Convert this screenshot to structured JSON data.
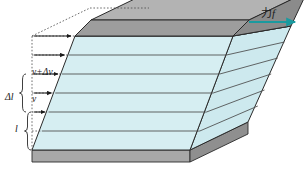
{
  "figure": {
    "labels": {
      "velocity_upper": "v+Δv",
      "delta_length": "Δl",
      "velocity_lower": "v",
      "length": "l",
      "force_word": "力",
      "force_symbol": "f"
    },
    "colors": {
      "front_face": "#d6eef2",
      "right_face": "#cde9ee",
      "top_face": "#9d9d9d",
      "top_face_edge": "#8a8a8a",
      "base_face": "#9d9d9d",
      "base_front": "#b5b5b5",
      "outline": "#2a2a2a",
      "layer_line": "#4a4a4a",
      "arrow_teal": "#1a9a9f",
      "dashed_line": "#4a4a4a",
      "background": "#ffffff"
    },
    "geometry": {
      "layer_count": 6,
      "velocity_arrow_count": 5,
      "shear_direction": "right"
    }
  }
}
